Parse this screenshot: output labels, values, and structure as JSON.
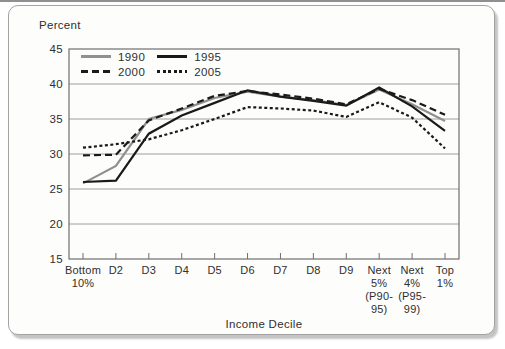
{
  "chart_data": {
    "type": "line",
    "title": "",
    "ylabel": "Percent",
    "xlabel": "Income Decile",
    "ylim": [
      15,
      45
    ],
    "yticks": [
      15,
      20,
      25,
      30,
      35,
      40,
      45
    ],
    "grid": "horizontal",
    "plot_frame": "full-box",
    "legend_position": "top-left-inside",
    "categories": [
      "Bottom 10%",
      "D2",
      "D3",
      "D4",
      "D5",
      "D6",
      "D7",
      "D8",
      "D9",
      "Next 5% (P90-95)",
      "Next 4% (P95-99)",
      "Top 1%"
    ],
    "category_label_lines": [
      [
        "Bottom",
        "10%"
      ],
      [
        "D2"
      ],
      [
        "D3"
      ],
      [
        "D4"
      ],
      [
        "D5"
      ],
      [
        "D6"
      ],
      [
        "D7"
      ],
      [
        "D8"
      ],
      [
        "D9"
      ],
      [
        "Next",
        "5%",
        "(P90-",
        "95)"
      ],
      [
        "Next",
        "4%",
        "(P95-",
        "99)"
      ],
      [
        "Top",
        "1%"
      ]
    ],
    "series": [
      {
        "name": "1990",
        "color": "#909090",
        "dash": null,
        "values": [
          25.8,
          28.3,
          35.0,
          36.3,
          38.0,
          38.9,
          38.2,
          37.7,
          37.0,
          39.2,
          37.1,
          34.7
        ]
      },
      {
        "name": "1995",
        "color": "#1a1a1a",
        "dash": null,
        "values": [
          26.0,
          26.2,
          32.9,
          35.5,
          37.3,
          39.1,
          38.2,
          37.6,
          36.9,
          39.5,
          36.8,
          33.3
        ]
      },
      {
        "name": "2000",
        "color": "#1a1a1a",
        "dash": [
          7,
          4
        ],
        "values": [
          29.8,
          29.9,
          34.8,
          36.5,
          38.3,
          39.0,
          38.5,
          37.9,
          37.1,
          39.3,
          37.7,
          35.6
        ]
      },
      {
        "name": "2005",
        "color": "#1a1a1a",
        "dash": [
          3,
          2.5
        ],
        "values": [
          30.9,
          31.4,
          32.1,
          33.4,
          35.0,
          36.7,
          36.5,
          36.2,
          35.3,
          37.4,
          35.2,
          30.8
        ]
      }
    ],
    "colors": {
      "grid_line": "#9e9e9e",
      "plot_frame": "#6f6f6f",
      "tick_text": "#2f2f2f",
      "card_border": "#a3a3a3"
    }
  }
}
